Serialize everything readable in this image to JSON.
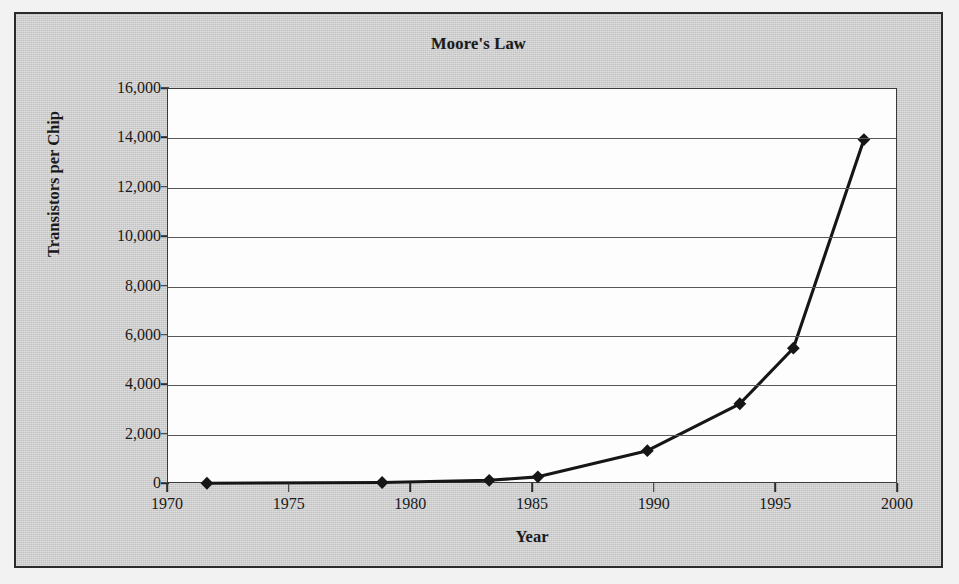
{
  "chart_data": {
    "type": "line",
    "title": "Moore's Law",
    "xlabel": "Year",
    "ylabel": "Transistors per Chip",
    "xlim": [
      1970,
      2000
    ],
    "ylim": [
      0,
      16000
    ],
    "xticks": [
      "1970",
      "1975",
      "1980",
      "1985",
      "1990",
      "1995",
      "2000"
    ],
    "xtick_values": [
      1970,
      1975,
      1980,
      1985,
      1990,
      1995,
      2000
    ],
    "yticks": [
      "0",
      "2,000",
      "4,000",
      "6,000",
      "8,000",
      "10,000",
      "12,000",
      "14,000",
      "16,000"
    ],
    "ytick_values": [
      0,
      2000,
      4000,
      6000,
      8000,
      10000,
      12000,
      14000,
      16000
    ],
    "grid": "horizontal",
    "legend": "none",
    "marker": "diamond",
    "series": [
      {
        "name": "Transistors per Chip",
        "x": [
          1971.6,
          1978.8,
          1983.2,
          1985.2,
          1989.7,
          1993.5,
          1995.7,
          1998.6
        ],
        "values": [
          30,
          60,
          150,
          290,
          1350,
          3250,
          5500,
          13950
        ]
      }
    ],
    "units": "thousands of transistors"
  }
}
